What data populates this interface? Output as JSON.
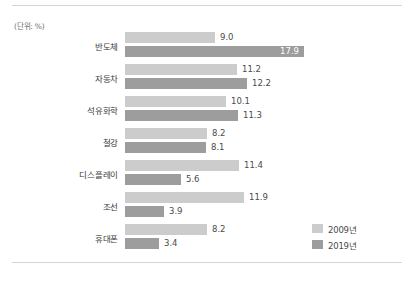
{
  "unit_note": "(단위: %)",
  "legend": {
    "position": "bottom-right",
    "items": [
      {
        "label": "2009년",
        "color": "#cccccc"
      },
      {
        "label": "2019년",
        "color": "#9d9d9d"
      }
    ]
  },
  "chart_data": {
    "type": "bar",
    "orientation": "horizontal",
    "title": "",
    "subtitle": "",
    "xlabel": "",
    "ylabel": "",
    "unit": "%",
    "grid": false,
    "legend_position": "bottom-right",
    "xlim": [
      0,
      17.9
    ],
    "px_per_unit": 10,
    "categories": [
      "반도체",
      "자동차",
      "석유화학",
      "철강",
      "디스플레이",
      "조선",
      "휴대폰"
    ],
    "series": [
      {
        "name": "2009년",
        "color": "#cccccc",
        "values": [
          9.0,
          11.2,
          10.1,
          8.2,
          11.4,
          11.9,
          8.2
        ],
        "labels": [
          "9.0",
          "11.2",
          "10.1",
          "8.2",
          "11.4",
          "11.9",
          "8.2"
        ],
        "label_placement": [
          "outside",
          "outside",
          "outside",
          "outside",
          "outside",
          "outside",
          "outside"
        ]
      },
      {
        "name": "2019년",
        "color": "#9d9d9d",
        "values": [
          17.9,
          12.2,
          11.3,
          8.1,
          5.6,
          3.9,
          3.4
        ],
        "labels": [
          "17.9",
          "12.2",
          "11.3",
          "8.1",
          "5.6",
          "3.9",
          "3.4"
        ],
        "label_placement": [
          "inside",
          "outside",
          "outside",
          "outside",
          "outside",
          "outside",
          "outside"
        ]
      }
    ]
  }
}
